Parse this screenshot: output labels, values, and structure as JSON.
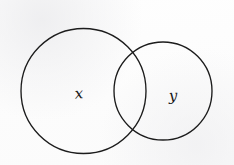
{
  "diagram": {
    "type": "venn-two-set-overlapping-circles",
    "background_color": "#fdfdfd",
    "stroke_color": "#1c1c1c",
    "stroke_width": 1.35,
    "canvas": {
      "width": 234,
      "height": 165
    },
    "sets": [
      {
        "id": "set-x",
        "label": "x",
        "role": "left-large-circle",
        "center_x": 83.5,
        "center_y": 91,
        "radius": 62.5,
        "label_x": 79,
        "label_y": 94,
        "fill": "none"
      },
      {
        "id": "set-y",
        "label": "y",
        "role": "right-small-circle",
        "center_x": 163,
        "center_y": 91,
        "radius": 49,
        "label_x": 173,
        "label_y": 96,
        "fill": "none"
      }
    ],
    "intersection": {
      "label": "",
      "top_point_x": 135,
      "top_point_y": 53,
      "bottom_point_x": 137,
      "bottom_point_y": 131
    }
  }
}
